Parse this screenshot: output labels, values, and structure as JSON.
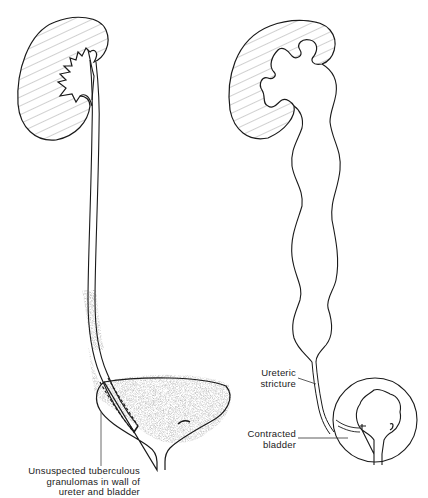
{
  "figure": {
    "type": "medical-illustration",
    "panels": [
      {
        "id": "left",
        "description": "Normal-appearing kidney and ureter with unsuspected tuberculous granulomas in ureter and bladder wall",
        "labels": [
          {
            "id": "granulomas",
            "lines": [
              "Unsuspected tuberculous",
              "granulomas in wall of",
              "ureter and bladder"
            ]
          }
        ]
      },
      {
        "id": "right",
        "description": "Hydronephrosis with dilated tortuous ureter above a ureteric stricture and contracted bladder",
        "labels": [
          {
            "id": "stricture",
            "lines": [
              "Ureteric",
              "stricture"
            ]
          },
          {
            "id": "contracted",
            "lines": [
              "Contracted",
              "bladder"
            ]
          }
        ]
      }
    ],
    "colors": {
      "line": "#1a1a1a",
      "hatch": "#6a6a6a",
      "stipple": "#9a9a9a",
      "background": "#ffffff"
    }
  }
}
